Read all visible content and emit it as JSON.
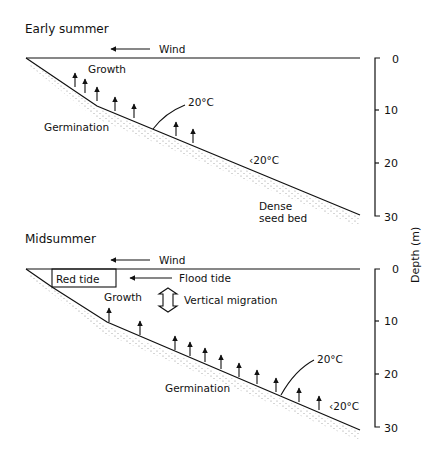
{
  "panels": [
    {
      "title": "Early summer",
      "wind_label": "Wind",
      "growth_label": "Growth",
      "germination_label": "Germination",
      "isotherm_label": "20°C",
      "cold_label": "‹20°C",
      "seed_bed_label_1": "Dense",
      "seed_bed_label_2": "seed bed"
    },
    {
      "title": "Midsummer",
      "wind_label": "Wind",
      "red_tide_label": "Red tide",
      "flood_tide_label": "Flood tide",
      "growth_label": "Growth",
      "migration_label": "Vertical migration",
      "germination_label": "Germination",
      "isotherm_label": "20°C",
      "cold_label": "‹20°C"
    }
  ],
  "axis": {
    "label": "Depth (m)",
    "ticks": [
      "0",
      "10",
      "20",
      "30"
    ]
  }
}
